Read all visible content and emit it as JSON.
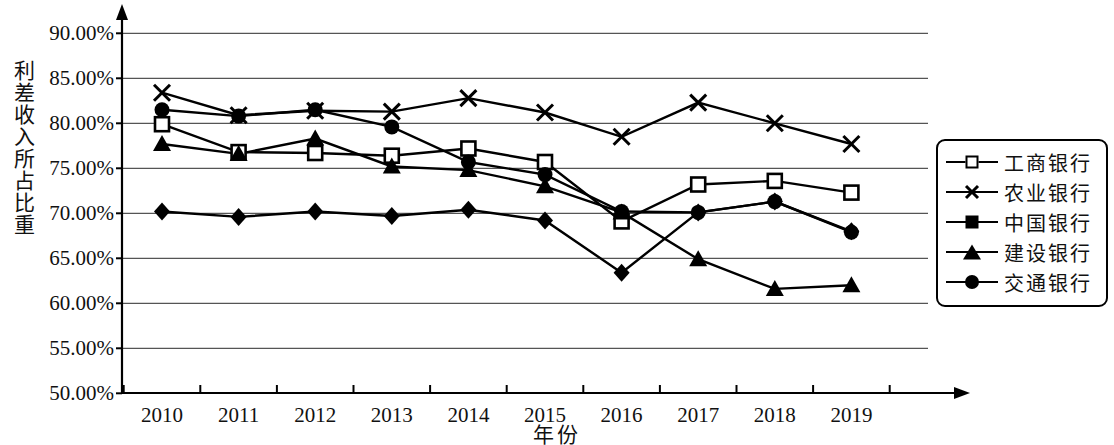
{
  "chart_data": {
    "type": "line",
    "title": "",
    "xlabel": "年份",
    "ylabel": "利差收入所占比重",
    "categories": [
      "2010",
      "2011",
      "2012",
      "2013",
      "2014",
      "2015",
      "2016",
      "2017",
      "2018",
      "2019"
    ],
    "ylim": [
      50,
      90
    ],
    "ytick_labels": [
      "90.00%",
      "85.00%",
      "80.00%",
      "75.00%",
      "70.00%",
      "65.00%",
      "60.00%",
      "55.00%",
      "50.00%"
    ],
    "ytick_values": [
      90,
      85,
      80,
      75,
      70,
      65,
      60,
      55,
      50
    ],
    "grid": true,
    "legend_position": "right",
    "series": [
      {
        "name": "工商银行",
        "marker": "open-square",
        "values": [
          79.9,
          76.8,
          76.7,
          76.4,
          77.2,
          75.7,
          69.1,
          73.2,
          73.6,
          72.3
        ]
      },
      {
        "name": "农业银行",
        "marker": "cross",
        "values": [
          83.4,
          80.9,
          81.4,
          81.3,
          82.8,
          81.2,
          78.5,
          82.3,
          80.0,
          77.7
        ]
      },
      {
        "name": "中国银行",
        "marker": "filled-diamond",
        "values": [
          70.2,
          69.6,
          70.2,
          69.7,
          70.4,
          69.2,
          63.4,
          70.1,
          71.3,
          68.0
        ]
      },
      {
        "name": "建设银行",
        "marker": "filled-triangle",
        "values": [
          77.7,
          76.6,
          78.3,
          75.2,
          74.8,
          73.0,
          70.1,
          64.9,
          61.6,
          62.0
        ]
      },
      {
        "name": "交通银行",
        "marker": "filled-circle",
        "values": [
          81.5,
          80.8,
          81.5,
          79.6,
          75.7,
          74.3,
          70.2,
          70.1,
          71.3,
          67.9
        ]
      }
    ]
  },
  "axis": {
    "y_title": "利差收入所占比重",
    "x_title": "年份"
  },
  "legend": {
    "items": [
      {
        "label": "工商银行",
        "marker": "open-square"
      },
      {
        "label": "农业银行",
        "marker": "cross"
      },
      {
        "label": "中国银行",
        "marker": "filled-diamond"
      },
      {
        "label": "建设银行",
        "marker": "filled-triangle"
      },
      {
        "label": "交通银行",
        "marker": "filled-circle"
      }
    ]
  },
  "colors": {
    "line": "#000000",
    "grid": "#555555",
    "axis": "#000000",
    "background": "#ffffff"
  }
}
